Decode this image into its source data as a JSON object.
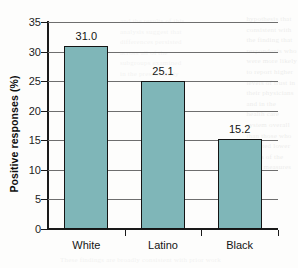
{
  "chart_data": {
    "type": "bar",
    "title": "",
    "subtitle": "",
    "xlabel": "",
    "ylabel": "Positive responses (%)",
    "categories": [
      "White",
      "Latino",
      "Black"
    ],
    "values": [
      31.0,
      25.1,
      15.2
    ],
    "value_labels": [
      "31.0",
      "25.1",
      "15.2"
    ],
    "ylim": [
      0,
      35
    ],
    "yticks": [
      0,
      5,
      10,
      15,
      20,
      25,
      30,
      35
    ],
    "ytick_labels": [
      "0",
      "5",
      "10",
      "15",
      "20",
      "25",
      "30",
      "35"
    ],
    "grid": "horizontal",
    "legend": "none",
    "series": [
      {
        "name": "Positive responses",
        "values": [
          31.0,
          25.1,
          15.2
        ]
      }
    ],
    "colors": {
      "bar_fill": "#7fb6b8",
      "bar_border": "#141414",
      "gridline": "#6e6e6e",
      "axis": "#1a1a1a",
      "text": "#141414",
      "background": "#fdfdfc"
    }
  },
  "background_text": {
    "right_column": [
      "hypothesis that",
      "consistent with",
      "the finding that",
      "respondents who",
      "were more likely",
      "to report higher",
      "levels of trust in",
      "their physicians",
      "and in the",
      "health care",
      "system overall",
      "than those who",
      "reported lower",
      "levels of the",
      "same measures"
    ],
    "mid_column": [
      "and the results of this",
      "analysis suggest that",
      "differences persisted",
      "across all of the",
      "subgroups examined",
      "in the present study"
    ],
    "bottom_line": "These findings are broadly consistent with prior work"
  }
}
